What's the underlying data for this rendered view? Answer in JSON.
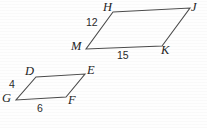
{
  "figure": {
    "type": "geometry-diagram",
    "background_color": "#fefefe",
    "stroke_color": "#4a4a4a",
    "label_color": "#242424",
    "canvas": {
      "width": 207,
      "height": 128
    },
    "shapes": [
      {
        "id": "large-parallelogram",
        "name": "parallelogram HJKM",
        "vertices": [
          {
            "label": "H",
            "x": 113,
            "y": 12
          },
          {
            "label": "J",
            "x": 190,
            "y": 8
          },
          {
            "label": "K",
            "x": 162,
            "y": 46
          },
          {
            "label": "M",
            "x": 86,
            "y": 49
          }
        ],
        "vertex_label_positions": [
          {
            "label": "H",
            "left": 103,
            "top": 1
          },
          {
            "label": "J",
            "left": 191,
            "top": 1
          },
          {
            "label": "K",
            "left": 161,
            "top": 44
          },
          {
            "label": "M",
            "left": 71,
            "top": 40
          }
        ],
        "side_labels": [
          {
            "text": "12",
            "side": "MH",
            "left": 86,
            "top": 17
          },
          {
            "text": "15",
            "side": "MK",
            "left": 117,
            "top": 50
          }
        ]
      },
      {
        "id": "small-parallelogram",
        "name": "parallelogram DEFG",
        "vertices": [
          {
            "label": "D",
            "x": 36,
            "y": 77
          },
          {
            "label": "E",
            "x": 85,
            "y": 74
          },
          {
            "label": "F",
            "x": 66,
            "y": 97
          },
          {
            "label": "G",
            "x": 16,
            "y": 100
          }
        ],
        "vertex_label_positions": [
          {
            "label": "D",
            "left": 25,
            "top": 65
          },
          {
            "label": "E",
            "left": 87,
            "top": 64
          },
          {
            "label": "F",
            "left": 68,
            "top": 94
          },
          {
            "label": "G",
            "left": 2,
            "top": 92
          }
        ],
        "side_labels": [
          {
            "text": "4",
            "side": "GD",
            "left": 9,
            "top": 79
          },
          {
            "text": "6",
            "side": "GF",
            "left": 37,
            "top": 103
          }
        ]
      }
    ]
  }
}
